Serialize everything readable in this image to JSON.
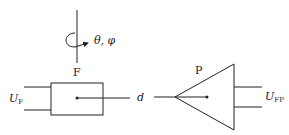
{
  "diagram": {
    "rotation_label": "θ, φ",
    "fiber_label": "F",
    "fiber_input_label": "U",
    "fiber_input_sub": "F",
    "distance_label": "d",
    "probe_label": "P",
    "probe_output_label": "U",
    "probe_output_sub": "FP"
  },
  "colors": {
    "stroke": "#222222",
    "background": "#ffffff"
  }
}
